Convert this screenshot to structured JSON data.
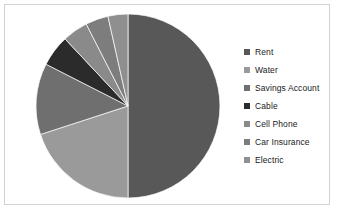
{
  "chart_data": {
    "type": "pie",
    "title": "",
    "labels": [
      "Rent",
      "Water",
      "Savings Account",
      "Cable",
      "Cell Phone",
      "Car Insurance",
      "Electric"
    ],
    "values": [
      50,
      20,
      12.5,
      5.5,
      4.5,
      4,
      3.5
    ],
    "colors": [
      "#585858",
      "#9a9a9a",
      "#6f6f6f",
      "#2b2b2b",
      "#8a8a8a",
      "#7d7d7d",
      "#8f8f8f"
    ],
    "legend_position": "right",
    "start_angle": 0,
    "direction": "clockwise",
    "grid": false
  },
  "legend": {
    "items": [
      {
        "label": "Rent",
        "color": "#585858"
      },
      {
        "label": "Water",
        "color": "#9a9a9a"
      },
      {
        "label": "Savings Account",
        "color": "#6f6f6f"
      },
      {
        "label": "Cable",
        "color": "#2b2b2b"
      },
      {
        "label": "Cell Phone",
        "color": "#8a8a8a"
      },
      {
        "label": "Car Insurance",
        "color": "#7d7d7d"
      },
      {
        "label": "Electric",
        "color": "#8f8f8f"
      }
    ]
  },
  "frame": {
    "border_color": "#d2d2d2",
    "background": "#ffffff"
  }
}
